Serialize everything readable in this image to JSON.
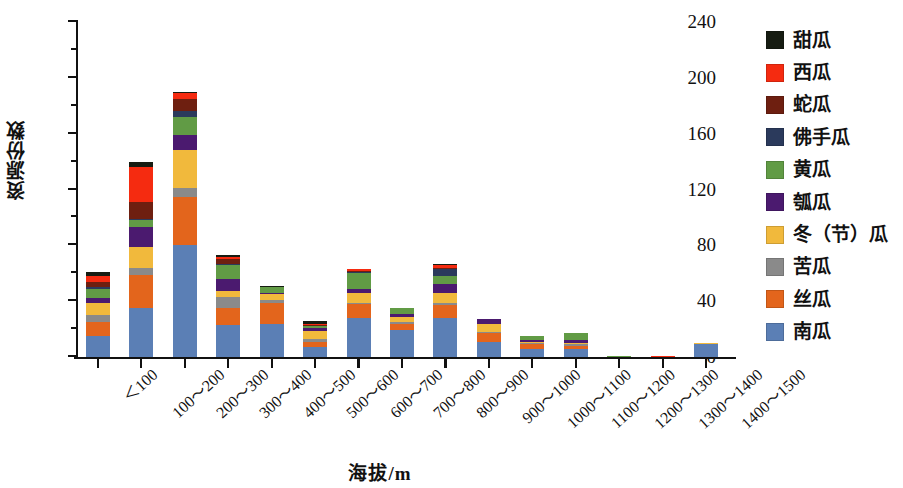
{
  "chart_data": {
    "type": "bar",
    "subtype": "stacked-bar",
    "title": "",
    "xlabel": "海拔/m",
    "ylabel": "资源份数",
    "ylim": [
      0,
      240
    ],
    "ytick_values": [
      0,
      40,
      80,
      120,
      160,
      200,
      240
    ],
    "ytick_labels": [
      "0",
      "40",
      "80",
      "120",
      "160",
      "200",
      "240"
    ],
    "yminor_step": 20,
    "grid": false,
    "legend_position": "right",
    "categories": [
      "＜100",
      "100～200",
      "200～300",
      "300～400",
      "400～500",
      "500～600",
      "600～700",
      "700～800",
      "800～900",
      "900～1000",
      "1000～1100",
      "1100～1200",
      "1200～1300",
      "1300～1400",
      "1400～1500"
    ],
    "series": [
      {
        "name": "南瓜",
        "color": "#5b7fb5",
        "values": [
          15,
          35,
          80,
          23,
          24,
          7,
          28,
          19,
          28,
          11,
          6,
          6,
          0,
          0,
          9
        ]
      },
      {
        "name": "丝瓜",
        "color": "#e3651c",
        "values": [
          10,
          24,
          35,
          12,
          15,
          4,
          10,
          5,
          9,
          6,
          3,
          2,
          0,
          0,
          0
        ]
      },
      {
        "name": "苦瓜",
        "color": "#8a8a8a",
        "values": [
          5,
          5,
          6,
          8,
          2,
          2,
          1,
          1,
          2,
          1,
          1,
          1,
          0,
          0,
          0
        ]
      },
      {
        "name": "冬（节）瓜",
        "color": "#f1b93c",
        "values": [
          9,
          15,
          27,
          4,
          4,
          6,
          7,
          4,
          7,
          6,
          1,
          1,
          0,
          0,
          1
        ]
      },
      {
        "name": "瓠瓜",
        "color": "#4b1a6f",
        "values": [
          3,
          14,
          11,
          9,
          1,
          2,
          3,
          2,
          6,
          3,
          1,
          2,
          0,
          0,
          0
        ]
      },
      {
        "name": "黄瓜",
        "color": "#619b45",
        "values": [
          7,
          5,
          13,
          10,
          4,
          1,
          11,
          4,
          6,
          0,
          3,
          5,
          1,
          0,
          0
        ]
      },
      {
        "name": "佛手瓜",
        "color": "#2b3a5c",
        "values": [
          1,
          1,
          4,
          1,
          0,
          0,
          1,
          0,
          5,
          0,
          0,
          0,
          0,
          0,
          0
        ]
      },
      {
        "name": "蛇瓜",
        "color": "#6e1f10",
        "values": [
          4,
          12,
          9,
          3,
          0,
          1,
          1,
          0,
          1,
          0,
          0,
          0,
          0,
          0,
          0
        ]
      },
      {
        "name": "西瓜",
        "color": "#f52b10",
        "values": [
          4,
          25,
          4,
          2,
          0,
          1,
          1,
          0,
          2,
          0,
          0,
          0,
          0,
          1,
          0
        ]
      },
      {
        "name": "甜瓜",
        "color": "#161c12",
        "values": [
          3,
          4,
          1,
          1,
          1,
          2,
          0,
          0,
          1,
          0,
          0,
          0,
          0,
          0,
          0
        ]
      }
    ],
    "totals": [
      61,
      140,
      190,
      73,
      51,
      26,
      63,
      35,
      67,
      27,
      15,
      17,
      1,
      1,
      10
    ]
  },
  "legend": {
    "items": [
      {
        "label": "甜瓜",
        "color": "#161c12"
      },
      {
        "label": "西瓜",
        "color": "#f52b10"
      },
      {
        "label": "蛇瓜",
        "color": "#6e1f10"
      },
      {
        "label": "佛手瓜",
        "color": "#2b3a5c"
      },
      {
        "label": "黄瓜",
        "color": "#619b45"
      },
      {
        "label": "瓠瓜",
        "color": "#4b1a6f"
      },
      {
        "label": "冬（节）瓜",
        "color": "#f1b93c"
      },
      {
        "label": "苦瓜",
        "color": "#8a8a8a"
      },
      {
        "label": "丝瓜",
        "color": "#e3651c"
      },
      {
        "label": "南瓜",
        "color": "#5b7fb5"
      }
    ]
  }
}
